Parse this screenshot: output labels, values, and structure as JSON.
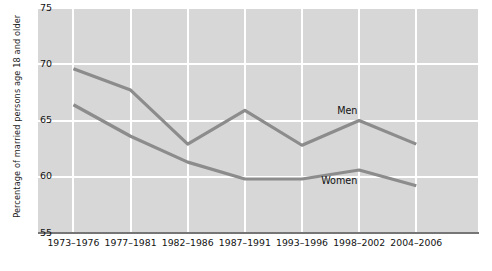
{
  "chart_data": {
    "type": "line",
    "title": "",
    "xlabel": "",
    "ylabel": "Percentage of married persons age 18 and older",
    "ylim": [
      55,
      75
    ],
    "yticks": [
      55,
      60,
      65,
      70,
      75
    ],
    "grid": true,
    "legend_position": "inline-labels",
    "categories": [
      "1973–1976",
      "1977–1981",
      "1982–1986",
      "1987–1991",
      "1993–1996",
      "1998–2002",
      "2004–2006"
    ],
    "series": [
      {
        "name": "Men",
        "color": "#8c8c8c",
        "values": [
          69.6,
          67.7,
          62.9,
          65.9,
          62.8,
          65.0,
          62.9
        ]
      },
      {
        "name": "Women",
        "color": "#8c8c8c",
        "values": [
          66.4,
          63.6,
          61.3,
          59.8,
          59.8,
          60.6,
          59.2
        ]
      }
    ]
  },
  "axis": {
    "y_title": "Percentage of married persons age 18 and older",
    "y_tick_labels": [
      "75",
      "70",
      "65",
      "60",
      "55"
    ],
    "x_tick_labels": [
      "1973–1976",
      "1977–1981",
      "1982–1986",
      "1987–1991",
      "1993–1996",
      "1998–2002",
      "2004–2006"
    ]
  },
  "labels": {
    "men": "Men",
    "women": "Women"
  },
  "colors": {
    "plot_background": "#d7d7d7",
    "gridline": "#ffffff",
    "series_line": "#8c8c8c",
    "axis_line": "#767676",
    "text": "#121212",
    "page_background": "#ffffff"
  }
}
